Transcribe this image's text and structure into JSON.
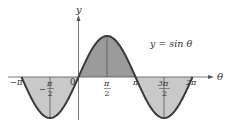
{
  "chart_data": {
    "type": "area",
    "title": "",
    "annotation": "y = sin θ",
    "xlabel": "θ",
    "ylabel": "y",
    "function": "sin",
    "x_range": [
      -3.14159,
      6.28319
    ],
    "ylim": [
      -1,
      1
    ],
    "grid": false,
    "legend": "none",
    "x_ticks": [
      {
        "value": -3.14159,
        "label": "−π"
      },
      {
        "value": -1.5708,
        "label": "−π/2"
      },
      {
        "value": 0,
        "label": "0"
      },
      {
        "value": 1.5708,
        "label": "π/2"
      },
      {
        "value": 3.14159,
        "label": "π"
      },
      {
        "value": 4.71239,
        "label": "3π/2"
      },
      {
        "value": 6.28319,
        "label": "2π"
      }
    ],
    "x": [
      -3.14159,
      -1.5708,
      0,
      1.5708,
      3.14159,
      4.71239,
      6.28319
    ],
    "series": [
      {
        "name": "y = sin θ",
        "values": [
          0,
          -1,
          0,
          1,
          0,
          -1,
          0
        ]
      }
    ],
    "shaded_regions": [
      {
        "from": -3.14159,
        "to": 0,
        "sign": "negative",
        "color": "#c9c9c9"
      },
      {
        "from": 0,
        "to": 3.14159,
        "sign": "positive",
        "color": "#9b9b9b"
      },
      {
        "from": 3.14159,
        "to": 6.28319,
        "sign": "negative",
        "color": "#c9c9c9"
      }
    ],
    "vertical_guides": [
      -1.5708,
      1.5708,
      4.71239
    ],
    "colors": {
      "curve": "#3a3a3a",
      "axis": "#555555",
      "positive_fill": "#9b9b9b",
      "negative_fill": "#c9c9c9"
    }
  },
  "labels": {
    "y_axis": "y",
    "x_axis": "θ",
    "equation": "y = sin θ",
    "neg_pi": "−π",
    "neg_pi_half_num": "π",
    "neg_pi_half_den": "2",
    "neg_sign": "−",
    "zero": "0",
    "pi_half_num": "π",
    "pi_half_den": "2",
    "pi": "π",
    "three_pi_half_num": "3π",
    "three_pi_half_den": "2",
    "two_pi": "2π"
  }
}
